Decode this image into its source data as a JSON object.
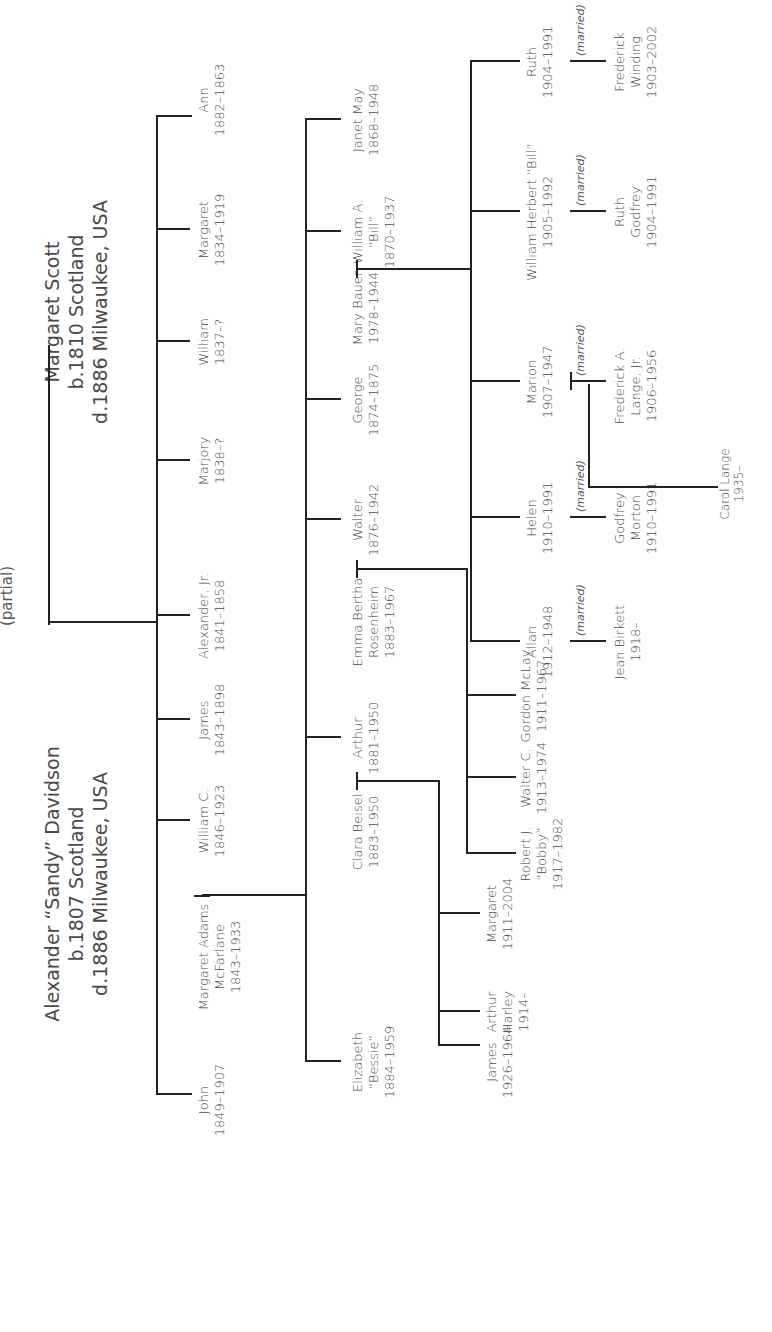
{
  "subtitle": "(partial)",
  "married_label": "(married)",
  "root": {
    "husband": {
      "name": "Alexander “Sandy” Davidson",
      "born": "b.1807 Scotland",
      "died": "d.1886 Milwaukee, USA"
    },
    "wife": {
      "name": "Margaret Scott",
      "born": "b.1810 Scotland",
      "died": "d.1886 Milwaukee, USA"
    }
  },
  "gen2": [
    {
      "name": "Ann",
      "dates": "1882–1863"
    },
    {
      "name": "Margaret",
      "dates": "1834–1919"
    },
    {
      "name": "William",
      "dates": "1837–?"
    },
    {
      "name": "Marjory",
      "dates": "1838–?"
    },
    {
      "name": "Alexander, Jr.",
      "dates": "1841–1858"
    },
    {
      "name": "James",
      "dates": "1843–1898"
    },
    {
      "name": "William C.",
      "dates": "1846–1923"
    },
    {
      "name": "Margaret Adams",
      "name2": "McFarlane",
      "dates": "1843–1933",
      "spouse_of": "William C."
    },
    {
      "name": "John",
      "dates": "1849–1907"
    }
  ],
  "gen3": [
    {
      "name": "Janet May",
      "dates": "1868–1948"
    },
    {
      "name": "William A.",
      "name2": "“Bill”",
      "dates": "1870–1937"
    },
    {
      "name": "Mary Bauer",
      "dates": "1978–1944",
      "spouse_of": "William A. “Bill”"
    },
    {
      "name": "George",
      "dates": "1874–1875"
    },
    {
      "name": "Walter",
      "dates": "1876–1942"
    },
    {
      "name": "Emma Bertha",
      "name2": "Rosenheim",
      "dates": "1883–1967",
      "spouse_of": "Walter"
    },
    {
      "name": "Arthur",
      "dates": "1881–1950"
    },
    {
      "name": "Clara Beisel",
      "dates": "1883–1950",
      "spouse_of": "Arthur"
    },
    {
      "name": "Elizabeth",
      "name2": "“Bessie”",
      "dates": "1884–1959"
    }
  ],
  "gen4_bill": [
    {
      "name": "Ruth",
      "dates": "1904–1991",
      "spouse": {
        "name": "Frederick",
        "name2": "Winding",
        "dates": "1903–2002"
      }
    },
    {
      "name": "William Herbert “Bill”",
      "dates": "1905–1992",
      "spouse": {
        "name": "Ruth",
        "name2": "Godfrey",
        "dates": "1904–1991"
      }
    },
    {
      "name": "Marion",
      "dates": "1907–1947",
      "spouse": {
        "name": "Frederick A.",
        "name2": "Lange, Jr.",
        "dates": "1906–1956"
      }
    },
    {
      "name": "Helen",
      "dates": "1910–1991",
      "spouse": {
        "name": "Godfrey",
        "name2": "Morton",
        "dates": "1910–1991"
      }
    },
    {
      "name": "Allan",
      "dates": "1912–1948",
      "spouse": {
        "name": "Jean Birkett",
        "dates": "1918–"
      }
    }
  ],
  "gen4_walter": [
    {
      "name": "Gordon McLay",
      "dates": "1911–1967"
    },
    {
      "name": "Walter C.",
      "dates": "1913–1974"
    },
    {
      "name": "Robert J.",
      "name2": "“Bobby”",
      "dates": "1917–1982"
    }
  ],
  "gen4_arthur": [
    {
      "name": "Margaret",
      "dates": "1911–2004"
    },
    {
      "name": "Arthur",
      "name2": "Harley",
      "dates": "1914–"
    },
    {
      "name": "James",
      "dates": "1926–1964"
    }
  ],
  "gen5": [
    {
      "name": "Carol Lange",
      "dates": "1935–",
      "parents": "Marion & Frederick A. Lange, Jr."
    }
  ]
}
